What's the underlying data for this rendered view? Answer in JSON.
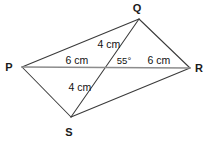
{
  "figure": {
    "type": "geometry-diagram",
    "shape": "quadrilateral-with-diagonals",
    "background_color": "#ffffff",
    "stroke_color": "#3a3a3a",
    "diagonal_pr_color": "#8c8c8c",
    "vertices": [
      {
        "id": "P",
        "label": "P",
        "x": 22,
        "y": 67,
        "label_x": 9,
        "label_y": 71
      },
      {
        "id": "Q",
        "label": "Q",
        "x": 139,
        "y": 19,
        "label_x": 135,
        "label_y": 12
      },
      {
        "id": "R",
        "label": "R",
        "x": 190,
        "y": 68,
        "label_x": 196,
        "label_y": 72
      },
      {
        "id": "S",
        "label": "S",
        "x": 71,
        "y": 117,
        "label_x": 66,
        "label_y": 134
      }
    ],
    "edges": [
      {
        "id": "PQ",
        "from": "P",
        "to": "Q"
      },
      {
        "id": "QR",
        "from": "Q",
        "to": "R"
      },
      {
        "id": "RS",
        "from": "R",
        "to": "S"
      },
      {
        "id": "SP",
        "from": "S",
        "to": "P"
      }
    ],
    "diagonals": [
      {
        "id": "PR",
        "from": "P",
        "to": "R",
        "color": "#8c8c8c"
      },
      {
        "id": "QS",
        "from": "Q",
        "to": "S",
        "color": "#3a3a3a"
      }
    ],
    "intersection": {
      "id": "O",
      "x": 106,
      "y": 66
    },
    "measurements": [
      {
        "id": "QO",
        "text": "4 cm",
        "segment": "Q-O",
        "x": 94,
        "y": 48
      },
      {
        "id": "PO",
        "text": "6 cm",
        "segment": "P-O",
        "x": 63,
        "y": 64
      },
      {
        "id": "OR",
        "text": "6 cm",
        "segment": "O-R",
        "x": 145,
        "y": 64
      },
      {
        "id": "OS",
        "text": "4 cm",
        "segment": "O-S",
        "x": 66,
        "y": 91
      }
    ],
    "angles": [
      {
        "id": "QOR",
        "text": "55°",
        "vertex": "O",
        "x": 114,
        "y": 64
      }
    ]
  }
}
